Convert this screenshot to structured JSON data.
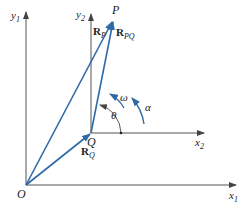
{
  "diagram": {
    "colors": {
      "axis": "#555555",
      "vector": "#2e6aa6",
      "text": "#222222",
      "background": "#ffffff"
    },
    "points": {
      "O": {
        "label": "O",
        "x": 26,
        "y": 185
      },
      "Q": {
        "label": "Q",
        "x": 91,
        "y": 133
      },
      "P": {
        "label": "P",
        "x": 113,
        "y": 20
      }
    },
    "axes": {
      "x1": {
        "label": "x",
        "sub": "1"
      },
      "y1": {
        "label": "y",
        "sub": "1"
      },
      "x2": {
        "label": "x",
        "sub": "2"
      },
      "y2": {
        "label": "y",
        "sub": "2"
      }
    },
    "vectors": {
      "RP": {
        "label": "R",
        "sub": "P",
        "from": "O",
        "to": "P"
      },
      "RQ": {
        "label": "R",
        "sub": "Q",
        "from": "O",
        "to": "Q"
      },
      "RPQ": {
        "label": "R",
        "sub": "PQ",
        "from": "Q",
        "to": "P"
      }
    },
    "angles": {
      "theta": "θ",
      "omega": "ω",
      "alpha": "α"
    }
  }
}
